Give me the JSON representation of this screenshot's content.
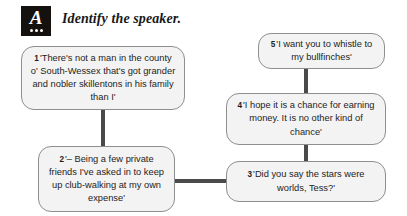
{
  "header": {
    "icon_name": "activity-icon-a",
    "icon_letter": "A",
    "title": "Identify the speaker."
  },
  "flow": {
    "boxes": [
      {
        "id": "box-1",
        "number": "1",
        "text": "'There's not a man in the county o' South-Wessex that's got grander and nobler skillentons in his family than I'"
      },
      {
        "id": "box-2",
        "number": "2",
        "text": "'– Being a few private friends I've asked in to keep up club-walking at my own expense'"
      },
      {
        "id": "box-3",
        "number": "3",
        "text": "'Did you say the stars were worlds, Tess?'"
      },
      {
        "id": "box-4",
        "number": "4",
        "text": "'I hope it is a chance for earning money. It is no other kind of chance'"
      },
      {
        "id": "box-5",
        "number": "5",
        "text": "'I want you to whistle to my bullfinches'"
      }
    ],
    "connectors": [
      {
        "id": "conn-1-2",
        "from": "1",
        "to": "2",
        "orientation": "vertical"
      },
      {
        "id": "conn-2-3",
        "from": "2",
        "to": "3",
        "orientation": "horizontal"
      },
      {
        "id": "conn-3-4",
        "from": "3",
        "to": "4",
        "orientation": "vertical"
      },
      {
        "id": "conn-4-5",
        "from": "4",
        "to": "5",
        "orientation": "vertical"
      }
    ]
  },
  "colors": {
    "box_fill": "#f3f3f3",
    "box_border": "#8e8e8e",
    "connector": "#4a4a4a",
    "icon_bg": "#15110f",
    "text": "#1d1d1d",
    "page_bg": "#ffffff"
  }
}
